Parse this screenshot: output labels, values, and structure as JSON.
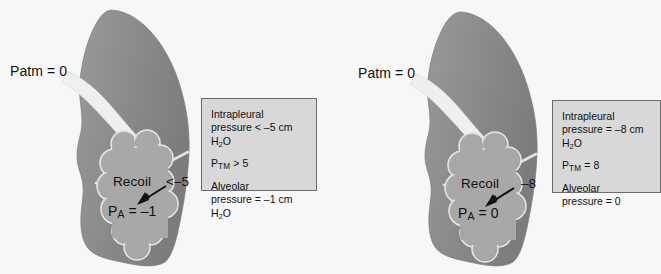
{
  "figure": {
    "type": "anatomical-diagram",
    "background_color": "#f7f7f7",
    "lung_color": "#8e8e8e",
    "alveoli_color": "#a8a8a8",
    "airway_color": "#ededed",
    "box_fill": "#d8d8d8",
    "box_border": "#6c6c6c",
    "text_color": "#111111"
  },
  "panels": [
    {
      "id": "left",
      "name": "end-inspiration-panel",
      "patm_label": "Patm = 0",
      "recoil_label": "Recoil",
      "intrapleural_marker": "<–5",
      "alveolar_label_prefix": "P",
      "alveolar_label_sub": "A",
      "alveolar_label_value": " = –1",
      "infobox": {
        "intrapleural_title": "Intrapleural",
        "intrapleural_value": "pressure < –5 cm H",
        "intrapleural_sub": "2",
        "intrapleural_unit": "O",
        "ptm_symbol": "P",
        "ptm_sub": "TM",
        "ptm_value": " > 5",
        "alveolar_title": "Alveolar",
        "alveolar_value": "pressure = –1 cm H",
        "alveolar_sub": "2",
        "alveolar_unit": "O"
      }
    },
    {
      "id": "right",
      "name": "end-expiration-panel",
      "patm_label": "Patm = 0",
      "recoil_label": "Recoil",
      "intrapleural_marker": "–8",
      "alveolar_label_prefix": "P",
      "alveolar_label_sub": "A",
      "alveolar_label_value": " = 0",
      "infobox": {
        "intrapleural_title": "Intrapleural",
        "intrapleural_value": "pressure = –8 cm H",
        "intrapleural_sub": "2",
        "intrapleural_unit": "O",
        "ptm_symbol": "P",
        "ptm_sub": "TM",
        "ptm_value": " = 8",
        "alveolar_title": "Alveolar",
        "alveolar_value": "pressure = 0",
        "alveolar_sub": "",
        "alveolar_unit": ""
      }
    }
  ]
}
